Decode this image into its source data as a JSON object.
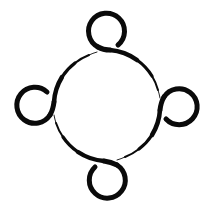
{
  "logo": {
    "description": "Four people in a circle community logo",
    "icon": "community-circle-icon",
    "stroke_color": "#0a0a0a",
    "background_color": "#ffffff",
    "big_circle": {
      "cx": 107,
      "cy": 106,
      "r": 54
    },
    "heads": [
      {
        "name": "top",
        "cx": 107,
        "cy": 31,
        "r": 18
      },
      {
        "name": "right",
        "cx": 179,
        "cy": 106,
        "r": 18
      },
      {
        "name": "bottom",
        "cx": 107,
        "cy": 180,
        "r": 18
      },
      {
        "name": "left",
        "cx": 34,
        "cy": 106,
        "r": 18
      }
    ]
  }
}
